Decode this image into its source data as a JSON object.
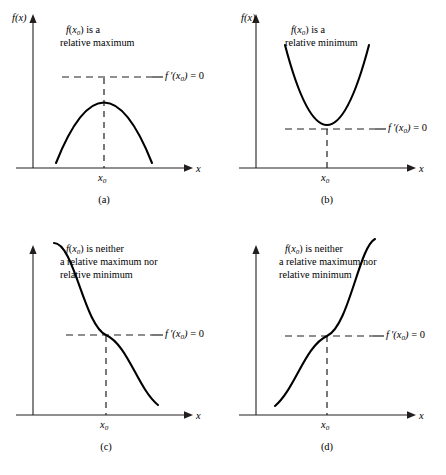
{
  "figure": {
    "axis_y_label": "f(x)",
    "axis_x_label": "x",
    "tick_label": "x",
    "tick_subscript": "0",
    "derivative_label_prefix": "f",
    "derivative_label_prime": "′(",
    "derivative_label_var": "x",
    "derivative_label_sub": "0",
    "derivative_label_suffix": ") = 0",
    "derivative_label_full": "f ′(x₀) = 0"
  },
  "panels": [
    {
      "id": "a",
      "letter": "(a)",
      "caption_lines": [
        "f(x₀) is a",
        "relative maximum"
      ],
      "caption_line1_math": "f(x",
      "caption_line1_sub": "0",
      "caption_line1_rest": ") is a",
      "caption_line2": "relative maximum",
      "shape": "downward-parabola",
      "derivative_label": "f ′(x₀) = 0"
    },
    {
      "id": "b",
      "letter": "(b)",
      "caption_lines": [
        "f(x₀) is a",
        "relative minimum"
      ],
      "caption_line1_math": "f(x",
      "caption_line1_sub": "0",
      "caption_line1_rest": ") is a",
      "caption_line2": "relative minimum",
      "shape": "upward-parabola",
      "derivative_label": "f ′(x₀) = 0"
    },
    {
      "id": "c",
      "letter": "(c)",
      "caption_lines": [
        "f(x₀) is neither",
        "a relative maximum nor",
        "relative minimum"
      ],
      "caption_line1_math": "f(x",
      "caption_line1_sub": "0",
      "caption_line1_rest": ") is neither",
      "caption_line2": "a relative maximum nor",
      "caption_line3": "relative minimum",
      "shape": "decreasing-cubic-saddle",
      "derivative_label": "f ′(x₀) = 0"
    },
    {
      "id": "d",
      "letter": "(d)",
      "caption_lines": [
        "f(x₀) is neither",
        "a relative maximum nor",
        "relative minimum"
      ],
      "caption_line1_math": "f(x",
      "caption_line1_sub": "0",
      "caption_line1_rest": ") is neither",
      "caption_line2": "a relative maximum nor",
      "caption_line3": "relative minimum",
      "shape": "increasing-cubic-saddle",
      "derivative_label": "f ′(x₀) = 0"
    }
  ],
  "chart_data": {
    "type": "line",
    "title": "",
    "xlabel": "x",
    "ylabel": "f(x)",
    "panels": [
      {
        "label": "(a)",
        "function": "downward parabola, relative maximum at x0",
        "critical_point_x": "x0",
        "derivative_at_critical_point": 0,
        "classification": "relative maximum"
      },
      {
        "label": "(b)",
        "function": "upward parabola, relative minimum at x0",
        "critical_point_x": "x0",
        "derivative_at_critical_point": 0,
        "classification": "relative minimum"
      },
      {
        "label": "(c)",
        "function": "decreasing cubic with horizontal inflection at x0",
        "critical_point_x": "x0",
        "derivative_at_critical_point": 0,
        "classification": "neither maximum nor minimum"
      },
      {
        "label": "(d)",
        "function": "increasing cubic with horizontal inflection at x0",
        "critical_point_x": "x0",
        "derivative_at_critical_point": 0,
        "classification": "neither maximum nor minimum"
      }
    ]
  }
}
